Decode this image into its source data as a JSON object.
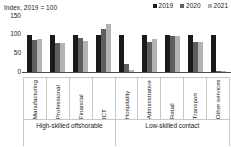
{
  "chart_data": {
    "type": "bar",
    "title": "Index, 2019 = 100",
    "xlabel": "",
    "ylabel": "",
    "ylim": [
      0,
      150
    ],
    "yticks": [
      150,
      100,
      50,
      0
    ],
    "grid": false,
    "legend_position": "top-right",
    "categories": [
      "Manufacturing",
      "Professional",
      "Financial",
      "ICT",
      "Hospitality",
      "Administrative",
      "Retail",
      "Transport",
      "Other services"
    ],
    "series": [
      {
        "name": "2019",
        "color": "#1a1a1a",
        "values": [
          100,
          100,
          100,
          100,
          100,
          100,
          100,
          100,
          100
        ]
      },
      {
        "name": "2020",
        "color": "#5e5e5e",
        "values": [
          86,
          79,
          92,
          116,
          22,
          80,
          97,
          80,
          4
        ]
      },
      {
        "name": "2021",
        "color": "#b3b3b3",
        "values": [
          88,
          78,
          83,
          128,
          6,
          88,
          96,
          80,
          3
        ]
      }
    ],
    "groups": [
      {
        "label": "High-skilled offshorable",
        "span": 4
      },
      {
        "label": "Low-skilled contact",
        "span": 5
      }
    ]
  }
}
